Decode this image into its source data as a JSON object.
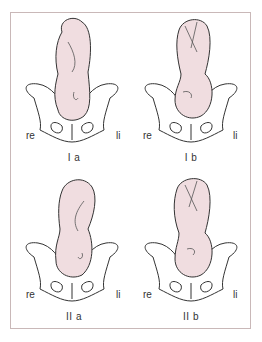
{
  "figure": {
    "panels": [
      {
        "id": "Ia",
        "caption": "I a",
        "left_label": "re",
        "right_label": "li",
        "fetus": "breech-back-left-flexed"
      },
      {
        "id": "Ib",
        "caption": "I b",
        "left_label": "re",
        "right_label": "li",
        "fetus": "cephalic-folded-limbs"
      },
      {
        "id": "IIa",
        "caption": "II a",
        "left_label": "re",
        "right_label": "li",
        "fetus": "breech-back-right-flexed"
      },
      {
        "id": "IIb",
        "caption": "II b",
        "left_label": "re",
        "right_label": "li",
        "fetus": "cephalic-folded-limbs-right"
      }
    ],
    "colors": {
      "skin": "#f0dde0",
      "outline": "#333333",
      "border": "#c9b8b8"
    }
  }
}
